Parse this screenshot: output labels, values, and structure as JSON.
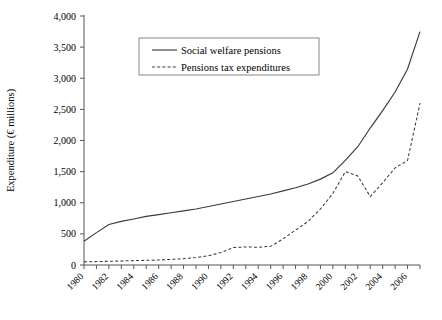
{
  "chart_data": {
    "type": "line",
    "title": "",
    "xlabel": "",
    "ylabel": "Expenditure (€ millions)",
    "ylim": [
      0,
      4000
    ],
    "xlim": [
      1980,
      2007
    ],
    "ytick_labels": [
      "0",
      "500",
      "1,000",
      "1,500",
      "2,000",
      "2,500",
      "3,000",
      "3,500",
      "4,000"
    ],
    "ytick_values": [
      0,
      500,
      1000,
      1500,
      2000,
      2500,
      3000,
      3500,
      4000
    ],
    "xtick_labels": [
      "1980",
      "1982",
      "1984",
      "1986",
      "1988",
      "1990",
      "1992",
      "1994",
      "1996",
      "1998",
      "2000",
      "2002",
      "2004",
      "2006"
    ],
    "xtick_values": [
      1980,
      1982,
      1984,
      1986,
      1988,
      1990,
      1992,
      1994,
      1996,
      1998,
      2000,
      2002,
      2004,
      2006
    ],
    "xtick_rotation": 45,
    "minor_xticks_every": 1,
    "grid": false,
    "legend_position": "upper-center",
    "x": [
      1980,
      1981,
      1982,
      1983,
      1984,
      1985,
      1986,
      1987,
      1988,
      1989,
      1990,
      1991,
      1992,
      1993,
      1994,
      1995,
      1996,
      1997,
      1998,
      1999,
      2000,
      2001,
      2002,
      2003,
      2004,
      2005,
      2006,
      2007
    ],
    "series": [
      {
        "name": "Social welfare pensions",
        "style": "solid",
        "color": "#3a3a3a",
        "values": [
          380,
          520,
          650,
          700,
          740,
          780,
          810,
          840,
          870,
          900,
          940,
          980,
          1020,
          1060,
          1100,
          1140,
          1190,
          1240,
          1300,
          1380,
          1480,
          1680,
          1900,
          2200,
          2480,
          2780,
          3150,
          3750
        ]
      },
      {
        "name": "Pensions tax expenditures",
        "style": "dashed",
        "color": "#3a3a3a",
        "values": [
          50,
          55,
          60,
          65,
          70,
          75,
          80,
          90,
          100,
          120,
          150,
          200,
          280,
          290,
          285,
          300,
          420,
          560,
          700,
          900,
          1150,
          1500,
          1430,
          1100,
          1320,
          1560,
          1680,
          2600
        ]
      }
    ]
  },
  "legend": {
    "entries": [
      {
        "label": "Social welfare pensions",
        "style": "solid"
      },
      {
        "label": "Pensions tax expenditures",
        "style": "dashed"
      }
    ]
  }
}
